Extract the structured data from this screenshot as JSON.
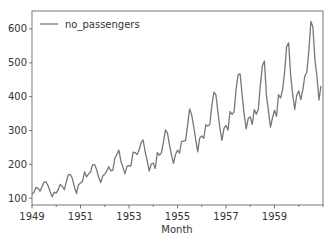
{
  "chart_data": {
    "type": "line",
    "title": "",
    "xlabel": "Month",
    "ylabel": "",
    "legend": {
      "position": "upper left",
      "entries": [
        "no_passengers"
      ]
    },
    "grid": false,
    "xlim": [
      "1949-01",
      "1961-01"
    ],
    "ylim": [
      80,
      653
    ],
    "x_ticks": [
      "1949",
      "1951",
      "1953",
      "1955",
      "1957",
      "1959"
    ],
    "y_ticks": [
      100,
      200,
      300,
      400,
      500,
      600
    ],
    "series": [
      {
        "name": "no_passengers",
        "color": "#777777",
        "x_start": "1949-01",
        "frequency": "monthly",
        "values": [
          112,
          118,
          132,
          129,
          121,
          135,
          148,
          148,
          136,
          119,
          104,
          118,
          115,
          126,
          141,
          135,
          125,
          149,
          170,
          170,
          158,
          133,
          114,
          140,
          145,
          150,
          178,
          163,
          172,
          178,
          199,
          199,
          184,
          162,
          146,
          166,
          171,
          180,
          193,
          181,
          183,
          218,
          230,
          242,
          209,
          191,
          172,
          194,
          196,
          196,
          236,
          235,
          229,
          243,
          264,
          272,
          237,
          211,
          180,
          201,
          204,
          188,
          235,
          227,
          234,
          264,
          302,
          293,
          259,
          229,
          203,
          229,
          242,
          233,
          267,
          269,
          270,
          315,
          364,
          347,
          312,
          274,
          237,
          278,
          284,
          277,
          317,
          313,
          318,
          374,
          413,
          405,
          355,
          306,
          271,
          306,
          315,
          301,
          356,
          348,
          355,
          422,
          465,
          467,
          404,
          347,
          305,
          336,
          340,
          318,
          362,
          348,
          363,
          435,
          491,
          505,
          404,
          359,
          310,
          337,
          360,
          342,
          406,
          396,
          420,
          472,
          548,
          559,
          463,
          407,
          362,
          405,
          417,
          391,
          419,
          461,
          472,
          535,
          622,
          606,
          508,
          461,
          390,
          432
        ]
      }
    ]
  },
  "axes": {
    "xlabel": "Month",
    "x_ticks": [
      "1949",
      "1951",
      "1953",
      "1955",
      "1957",
      "1959"
    ],
    "y_ticks": [
      "100",
      "200",
      "300",
      "400",
      "500",
      "600"
    ]
  },
  "legend": {
    "label": "no_passengers"
  }
}
